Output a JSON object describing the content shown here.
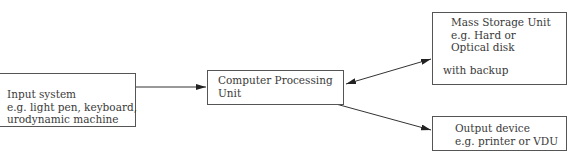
{
  "diagram": {
    "nodes": {
      "input": {
        "lines": [
          "Input system",
          "e.g. light pen, keyboard,",
          "urodynamic machine"
        ]
      },
      "cpu": {
        "lines": [
          "Computer Processing",
          "Unit"
        ]
      },
      "storage": {
        "lines": [
          "Mass Storage Unit",
          "e.g. Hard or",
          "Optical disk"
        ],
        "note": "with backup"
      },
      "output": {
        "lines": [
          "Output device",
          "e.g. printer or VDU"
        ]
      }
    },
    "edges": [
      {
        "from": "input",
        "to": "cpu",
        "type": "single-arrow"
      },
      {
        "from": "cpu",
        "to": "storage",
        "type": "double-arrow"
      },
      {
        "from": "cpu",
        "to": "output",
        "type": "single-arrow"
      }
    ],
    "colors": {
      "line": "#333333",
      "text": "#3a3a3a",
      "background": "#ffffff"
    }
  }
}
